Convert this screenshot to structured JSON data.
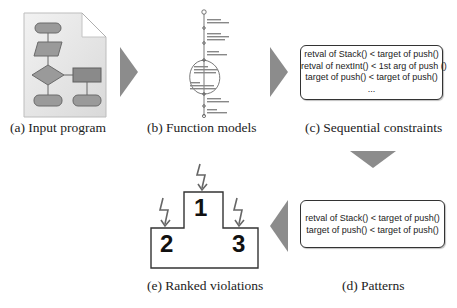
{
  "stages": {
    "a": {
      "caption": "(a) Input program",
      "icon": "flowchart-document-icon"
    },
    "b": {
      "caption": "(b) Function models",
      "icon": "state-machine-icon"
    },
    "c": {
      "caption": "(c) Sequential constraints",
      "lines": [
        "retval of Stack() < target of push()",
        "retval of nextInt() < 1st arg of push ()",
        "target of push() < target of push()",
        "..."
      ]
    },
    "d": {
      "caption": "(d) Patterns",
      "lines": [
        "retval of Stack() < target of push()",
        "target of push() < target of push()"
      ]
    },
    "e": {
      "caption": "(e) Ranked violations",
      "ranks": [
        "1",
        "2",
        "3"
      ],
      "icon": "podium-icon"
    }
  },
  "colors": {
    "arrow": "#8c8c8c",
    "podium_stroke": "#333333",
    "bolt": "#666666"
  }
}
